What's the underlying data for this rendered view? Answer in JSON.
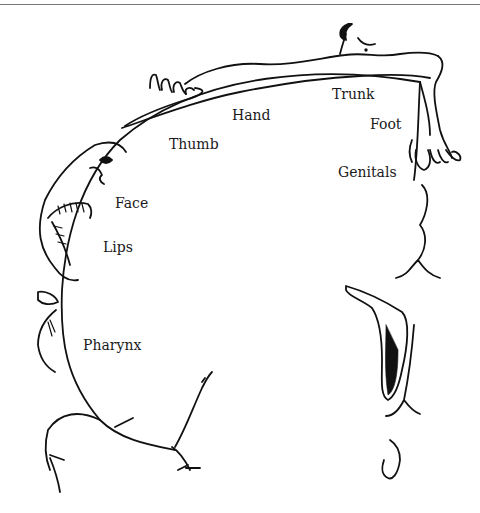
{
  "diagram": {
    "type": "sensory homunculus (cortical map)",
    "labels": [
      {
        "id": "trunk",
        "text": "Trunk"
      },
      {
        "id": "hand",
        "text": "Hand"
      },
      {
        "id": "foot",
        "text": "Foot"
      },
      {
        "id": "thumb",
        "text": "Thumb"
      },
      {
        "id": "genitals",
        "text": "Genitals"
      },
      {
        "id": "face",
        "text": "Face"
      },
      {
        "id": "lips",
        "text": "Lips"
      },
      {
        "id": "pharynx",
        "text": "Pharynx"
      }
    ],
    "stroke_color": "#111111",
    "background": "#ffffff"
  }
}
